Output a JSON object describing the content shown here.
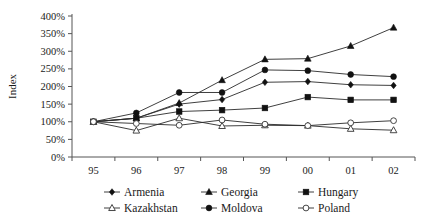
{
  "chart_data": {
    "type": "line",
    "title": "",
    "xlabel": "",
    "ylabel": "Index",
    "x": [
      "95",
      "96",
      "97",
      "98",
      "99",
      "00",
      "01",
      "02"
    ],
    "categories": [
      "95",
      "96",
      "97",
      "98",
      "99",
      "00",
      "01",
      "02"
    ],
    "ylim": [
      0,
      400
    ],
    "ytick_values": [
      0,
      50,
      100,
      150,
      200,
      250,
      300,
      350,
      400
    ],
    "ytick_labels": [
      "0%",
      "50%",
      "100%",
      "150%",
      "200%",
      "250%",
      "300%",
      "350%",
      "400%"
    ],
    "grid": false,
    "legend_position": "bottom",
    "units": "percent",
    "series": [
      {
        "name": "Armenia",
        "marker": "filled-diamond",
        "values": [
          100,
          110,
          150,
          163,
          212,
          214,
          205,
          203
        ]
      },
      {
        "name": "Georgia",
        "marker": "filled-triangle",
        "values": [
          100,
          110,
          153,
          218,
          277,
          279,
          315,
          367
        ]
      },
      {
        "name": "Hungary",
        "marker": "filled-square",
        "values": [
          100,
          110,
          129,
          133,
          139,
          170,
          162,
          162
        ]
      },
      {
        "name": "Kazakhstan",
        "marker": "open-triangle",
        "values": [
          100,
          75,
          110,
          88,
          90,
          89,
          80,
          76
        ]
      },
      {
        "name": "Moldova",
        "marker": "filled-circle",
        "values": [
          100,
          125,
          183,
          183,
          247,
          245,
          234,
          228
        ]
      },
      {
        "name": "Poland",
        "marker": "open-circle",
        "values": [
          100,
          95,
          90,
          105,
          93,
          89,
          97,
          103
        ]
      }
    ]
  },
  "legend": {
    "entries": [
      {
        "label": "Armenia",
        "marker": "filled-diamond"
      },
      {
        "label": "Georgia",
        "marker": "filled-triangle"
      },
      {
        "label": "Hungary",
        "marker": "filled-square"
      },
      {
        "label": "Kazakhstan",
        "marker": "open-triangle"
      },
      {
        "label": "Moldova",
        "marker": "filled-circle"
      },
      {
        "label": "Poland",
        "marker": "open-circle"
      }
    ]
  },
  "colors": {
    "line": "#2a2a2a",
    "marker_fill": "#111111",
    "marker_open_fill": "#ffffff",
    "axis": "#555555",
    "text": "#1a1a1a",
    "background": "#ffffff"
  }
}
